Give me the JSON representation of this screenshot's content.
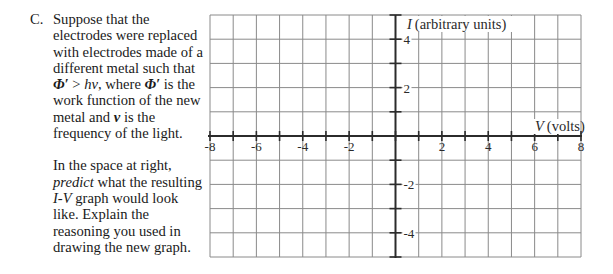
{
  "question": {
    "letter": "C.",
    "paragraph1": {
      "intro": "Suppose that the electrodes were replaced with electrodes made of a different metal such that ",
      "phi_prime": "Φ′",
      "gt": " > ",
      "hv": "hv",
      "where": ", where ",
      "phi_prime2": "Φ′",
      "is_work_function": " is the work function of the new metal and ",
      "v": "v",
      "is_frequency": " is the frequency of the light."
    },
    "paragraph2": {
      "lead": "In the space at right, ",
      "predict": "predict",
      "after_predict": " what the resulting ",
      "iv": "I-V",
      "rest": " graph would look like.  Explain the reasoning you used in drawing the new graph."
    }
  },
  "chart_data": {
    "type": "line",
    "title": "",
    "xlabel_var": "V",
    "xlabel_unit": "(volts)",
    "ylabel_var": "I",
    "ylabel_unit": "(arbitrary units)",
    "xlim": [
      -8,
      8
    ],
    "ylim": [
      -5,
      5
    ],
    "x_ticks": [
      -8,
      -7,
      -6,
      -5,
      -4,
      -3,
      -2,
      -1,
      0,
      1,
      2,
      3,
      4,
      5,
      6,
      7,
      8
    ],
    "x_tick_labels": [
      "-8",
      "-6",
      "-4",
      "-2",
      "2",
      "4",
      "6",
      "8"
    ],
    "y_ticks": [
      -5,
      -4,
      -3,
      -2,
      -1,
      0,
      1,
      2,
      3,
      4,
      5
    ],
    "y_tick_labels": [
      "4",
      "2",
      "-2",
      "-4"
    ],
    "grid": true,
    "series": [],
    "note": "Blank grid provided for student to sketch predicted I-V graph"
  },
  "colors": {
    "grid": "#8a8a8a",
    "axis": "#2b2b2b",
    "text": "#1a1a1a"
  }
}
